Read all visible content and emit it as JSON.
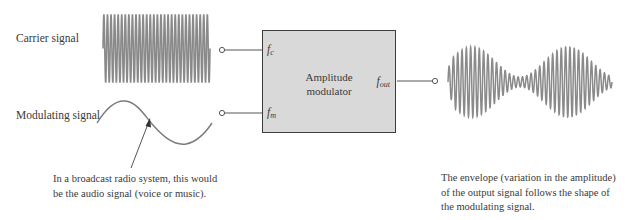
{
  "labels": {
    "carrier": "Carrier signal",
    "modulating": "Modulating signal"
  },
  "block": {
    "title_line1": "Amplitude",
    "title_line2": "modulator",
    "ports": {
      "carrier_in": {
        "symbol": "f",
        "sub": "c"
      },
      "modulating_in": {
        "symbol": "f",
        "sub": "m"
      },
      "output": {
        "symbol": "f",
        "sub": "out"
      }
    }
  },
  "annotations": {
    "modulating_note": {
      "line1": "In a broadcast radio system, this would",
      "line2": "be the audio signal (voice or music)."
    },
    "output_note": {
      "line1": "The envelope (variation in the amplitude)",
      "line2": "of the output signal follows the shape of",
      "line3": "the modulating signal."
    }
  },
  "colors": {
    "waveform": "#8a8a8a",
    "wire": "#555555",
    "box_fill": "#d9d9d9",
    "box_border": "#3c3c3c",
    "text": "#3a3a3a"
  }
}
